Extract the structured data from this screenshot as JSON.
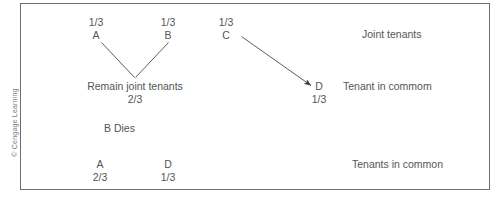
{
  "figure": {
    "copyright": "© Cengage Learning"
  },
  "diagram": {
    "type": "flow",
    "title": "",
    "top_row": {
      "parties": [
        {
          "id": "A",
          "share": "1/3",
          "name": "A"
        },
        {
          "id": "B",
          "share": "1/3",
          "name": "B"
        },
        {
          "id": "C",
          "share": "1/3",
          "name": "C"
        }
      ],
      "status_label": "Joint tenants"
    },
    "middle_row": {
      "remain_label": "Remain joint tenants",
      "remain_share": "2/3",
      "party": {
        "id": "D",
        "share": "1/3",
        "name": "D"
      },
      "status_label": "Tenant in commom"
    },
    "event": {
      "label": "B Dies"
    },
    "bottom_row": {
      "parties": [
        {
          "id": "A",
          "share": "2/3",
          "name": "A"
        },
        {
          "id": "D",
          "share": "1/3",
          "name": "D"
        }
      ],
      "status_label": "Tenants in common"
    },
    "connectors": [
      {
        "name": "a-to-merge",
        "from": "A",
        "to": "remain-joint-tenants",
        "style": "line"
      },
      {
        "name": "b-to-merge",
        "from": "B",
        "to": "remain-joint-tenants",
        "style": "line"
      },
      {
        "name": "c-to-d",
        "from": "C",
        "to": "D",
        "style": "arrow"
      }
    ],
    "colors": {
      "border": "#6e6e6e",
      "text": "#555555",
      "line": "#4a4a4a",
      "background": "#ffffff"
    }
  }
}
